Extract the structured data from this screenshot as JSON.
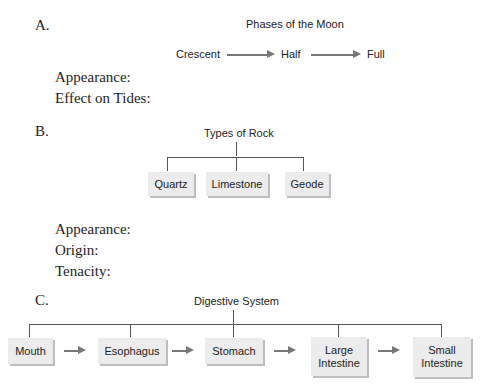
{
  "sections": {
    "a": {
      "letter": "A.",
      "title": "Phases of the Moon",
      "sequence": [
        "Crescent",
        "Half",
        "Full"
      ],
      "prompts": [
        "Appearance:",
        "Effect on Tides:"
      ]
    },
    "b": {
      "letter": "B.",
      "title": "Types of Rock",
      "boxes": [
        "Quartz",
        "Limestone",
        "Geode"
      ],
      "prompts": [
        "Appearance:",
        "Origin:",
        "Tenacity:"
      ]
    },
    "c": {
      "letter": "C.",
      "title": "Digestive System",
      "boxes": [
        "Mouth",
        "Esophagus",
        "Stomach",
        "Large Intestine",
        "Small Intestine"
      ]
    }
  },
  "colors": {
    "box_fill": "#ececec",
    "box_shadow": "#bdbdbd",
    "line": "#555555",
    "arrow": "#777777"
  }
}
